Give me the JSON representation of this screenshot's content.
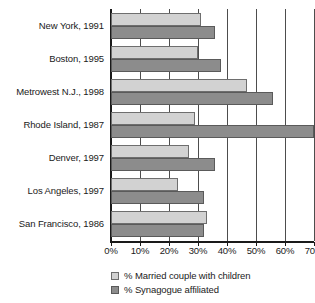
{
  "chart_data": {
    "type": "bar",
    "orientation": "horizontal",
    "title": "",
    "xlabel": "",
    "ylabel": "",
    "xlim": [
      0,
      70
    ],
    "xtick_labels": [
      "0%",
      "10%",
      "20%",
      "30%",
      "40%",
      "50%",
      "60%",
      "70%"
    ],
    "xticks": [
      0,
      10,
      20,
      30,
      40,
      50,
      60,
      70
    ],
    "grid": true,
    "legend_position": "bottom-left",
    "categories": [
      "New York, 1991",
      "Boston, 1995",
      "Metrowest N.J., 1998",
      "Rhode Island, 1987",
      "Denver, 1997",
      "Los Angeles, 1997",
      "San Francisco, 1986"
    ],
    "series": [
      {
        "name": "% Married couple with children",
        "color": "#d2d2d2",
        "values": [
          31,
          30,
          47,
          29,
          27,
          23,
          33
        ]
      },
      {
        "name": "% Synagogue affiliated",
        "color": "#8c8c8c",
        "values": [
          36,
          38,
          56,
          70,
          36,
          32,
          32
        ]
      }
    ]
  },
  "legend": {
    "items": [
      {
        "label": "% Married couple with children"
      },
      {
        "label": "% Synagogue affiliated"
      }
    ]
  }
}
